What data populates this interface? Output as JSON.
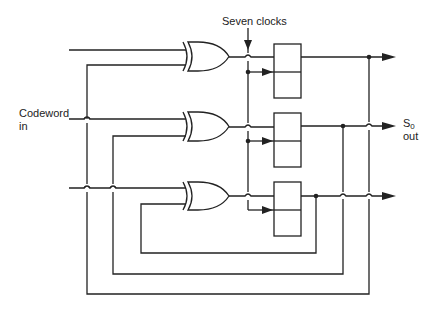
{
  "diagram": {
    "type": "circuit-schematic",
    "labels": {
      "clock_label": "Seven clocks",
      "input_label_line1": "Codeword",
      "input_label_line2": "in",
      "output_label_main": "S",
      "output_label_sub": "0",
      "output_label_line2": "out"
    },
    "components": {
      "xor_gates": [
        {
          "id": "xor-1",
          "inputs": [
            "codeword-in",
            "feedback-loop-3"
          ]
        },
        {
          "id": "xor-2",
          "inputs": [
            "codeword-in",
            "feedback-loop-2"
          ]
        },
        {
          "id": "xor-3",
          "inputs": [
            "codeword-in",
            "feedback-loop-1"
          ]
        }
      ],
      "registers": [
        {
          "id": "register-1",
          "clock": "seven-clocks"
        },
        {
          "id": "register-2",
          "clock": "seven-clocks"
        },
        {
          "id": "register-3",
          "clock": "seven-clocks"
        }
      ],
      "outputs": [
        "output-1",
        "S0-out",
        "output-3"
      ]
    },
    "colors": {
      "line": "#222222",
      "background": "#ffffff"
    }
  }
}
